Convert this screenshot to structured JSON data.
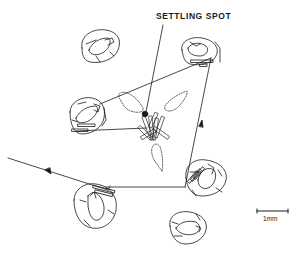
{
  "diagram": {
    "annotation_label": "SETTLING SPOT",
    "scale_bar_label": "1mm",
    "colors": {
      "ink": "#1a1a1a",
      "background": "#ffffff"
    },
    "elements": {
      "plants": [
        {
          "id": "top-left",
          "x": 100,
          "y": 45
        },
        {
          "id": "top-right",
          "x": 198,
          "y": 50
        },
        {
          "id": "mid-left",
          "x": 85,
          "y": 115
        },
        {
          "id": "mid-right",
          "x": 208,
          "y": 175
        },
        {
          "id": "bottom-left",
          "x": 95,
          "y": 205
        },
        {
          "id": "bottom-right",
          "x": 187,
          "y": 225
        }
      ],
      "settling_spot": {
        "x": 145,
        "y": 114
      },
      "path_arrows": 3,
      "dotted_loops": 3
    }
  }
}
